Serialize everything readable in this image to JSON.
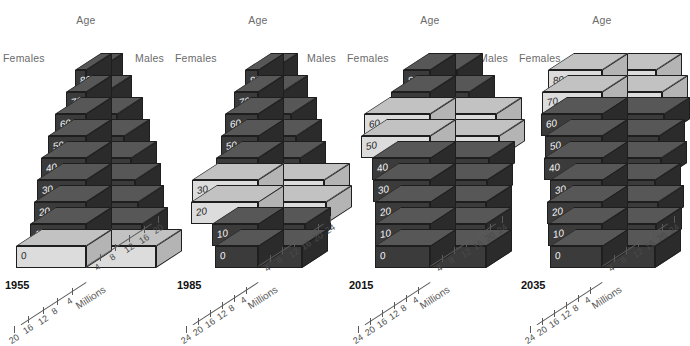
{
  "figure": {
    "background": "#ffffff",
    "color_dark": "#3b3b3b",
    "color_light": "#dcdcdc",
    "axis_title": "Millions",
    "age_label": "Age",
    "females_label": "Females",
    "males_label": "Males"
  },
  "chart_data": {
    "type": "bar",
    "title": "Age",
    "xlabel": "Millions",
    "ylabel": "Age",
    "subtype": "population-pyramid",
    "legend_position": "none",
    "grid": false,
    "categories": [
      "0",
      "10",
      "20",
      "30",
      "40",
      "50",
      "60",
      "70",
      "80+"
    ],
    "panels": [
      {
        "year": "1955",
        "females_label": "Females",
        "males_label": "Males",
        "age_label": "Age",
        "axis_title": "Millions",
        "xlim": [
          0,
          20
        ],
        "ticks_left": [
          "20",
          "16",
          "12",
          "8",
          "4"
        ],
        "ticks_right": [
          "4",
          "8",
          "12",
          "16",
          "20"
        ],
        "highlight_ages": [
          "0"
        ],
        "series": [
          {
            "name": "Females",
            "values": [
              19.5,
              15.5,
              14.5,
              13.5,
              12.5,
              10.5,
              8.5,
              5.5,
              3.0
            ]
          },
          {
            "name": "Males",
            "values": [
              19.5,
              15.5,
              14.5,
              13.5,
              12.5,
              10.5,
              8.5,
              5.5,
              3.0
            ]
          }
        ]
      },
      {
        "year": "1985",
        "females_label": "Females",
        "males_label": "Males",
        "age_label": "Age",
        "axis_title": "Millions",
        "xlim": [
          0,
          24
        ],
        "ticks_left": [
          "24",
          "20",
          "16",
          "12",
          "8",
          "4"
        ],
        "ticks_right": [
          "4",
          "8",
          "12",
          "16",
          "20",
          "24"
        ],
        "highlight_ages": [
          "20",
          "30"
        ],
        "series": [
          {
            "name": "Females",
            "values": [
              14.5,
              15.5,
              22.5,
              22.0,
              14.0,
              12.5,
              11.0,
              8.0,
              4.5
            ]
          },
          {
            "name": "Males",
            "values": [
              14.5,
              15.5,
              22.5,
              22.0,
              14.0,
              12.5,
              11.0,
              8.0,
              4.5
            ]
          }
        ]
      },
      {
        "year": "2015",
        "females_label": "Females",
        "males_label": "Males",
        "age_label": "Age",
        "axis_title": "Millions",
        "xlim": [
          0,
          24
        ],
        "ticks_left": [
          "24",
          "20",
          "16",
          "12",
          "8",
          "4"
        ],
        "ticks_right": [
          "4",
          "8",
          "12",
          "16",
          "20",
          "24"
        ],
        "highlight_ages": [
          "50",
          "60"
        ],
        "series": [
          {
            "name": "Females",
            "values": [
              18.5,
              18.5,
              18.5,
              19.0,
              19.5,
              23.0,
              22.0,
              13.0,
              9.0
            ]
          },
          {
            "name": "Males",
            "values": [
              18.5,
              18.5,
              18.5,
              19.0,
              19.5,
              23.0,
              22.0,
              13.0,
              9.0
            ]
          }
        ]
      },
      {
        "year": "2035",
        "females_label": "Females",
        "males_label": "Males",
        "age_label": "Age",
        "axis_title": "Millions",
        "xlim": [
          0,
          24
        ],
        "ticks_left": [
          "24",
          "20",
          "16",
          "12",
          "8",
          "4"
        ],
        "ticks_right": [
          "4",
          "8",
          "12",
          "16",
          "20",
          "24"
        ],
        "highlight_ages": [
          "70",
          "80+"
        ],
        "series": [
          {
            "name": "Females",
            "values": [
              17.5,
              18.0,
              18.5,
              17.5,
              19.5,
              19.0,
              20.5,
              20.0,
              18.0
            ]
          },
          {
            "name": "Males",
            "values": [
              17.5,
              18.0,
              18.5,
              17.5,
              19.5,
              19.0,
              20.5,
              20.0,
              18.0
            ]
          }
        ]
      }
    ]
  }
}
